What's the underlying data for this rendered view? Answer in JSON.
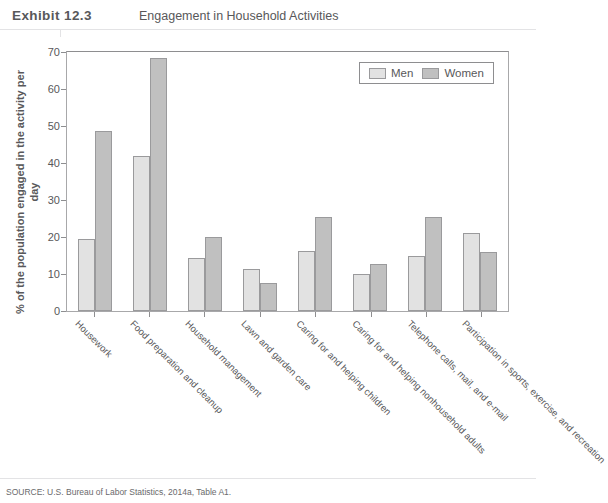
{
  "header": {
    "exhibit_word": "Exhibit",
    "exhibit_number": "12.3",
    "title": "Engagement in Household Activities"
  },
  "source": {
    "text": "SOURCE: U.S. Bureau of Labor Statistics, 2014a, Table A1."
  },
  "legend": {
    "position": "top-right",
    "items": [
      {
        "label": "Men",
        "color": "#e2e2e2"
      },
      {
        "label": "Women",
        "color": "#c0c0c0"
      }
    ]
  },
  "axes": {
    "ylabel": "% of the population engaged in the activity per day",
    "yticks": [
      "0",
      "10",
      "20",
      "30",
      "40",
      "50",
      "60",
      "70"
    ],
    "ymin": 0,
    "ymax": 70
  },
  "chart_data": {
    "type": "bar",
    "title": "Engagement in Household Activities",
    "xlabel": "",
    "ylabel": "% of the population engaged in the activity per day",
    "ylim": [
      0,
      70
    ],
    "ytick_step": 10,
    "grid": false,
    "legend_position": "top-right",
    "categories": [
      "Housework",
      "Food preparation and cleanup",
      "Household management",
      "Lawn and garden care",
      "Caring for and helping children",
      "Caring for and helping nonhousehold adults",
      "Telephone calls, mail, and e-mail",
      "Participation in sports, exercise, and recreation"
    ],
    "series": [
      {
        "name": "Men",
        "color": "#e2e2e2",
        "values": [
          19.5,
          41.8,
          14.3,
          11.4,
          16.1,
          10.0,
          15.0,
          21.1
        ]
      },
      {
        "name": "Women",
        "color": "#c0c0c0",
        "values": [
          48.7,
          68.4,
          20.1,
          7.5,
          25.3,
          12.8,
          25.3,
          16.0
        ]
      }
    ]
  }
}
